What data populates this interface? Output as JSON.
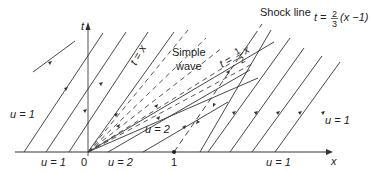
{
  "figure": {
    "type": "characteristics-diagram",
    "colors": {
      "line": "#333333",
      "background": "#ffffff"
    },
    "axes": {
      "x_label": "x",
      "t_label": "t",
      "origin_label": "0",
      "tick_one_label": "1"
    },
    "region_labels": {
      "left_upper": "u = 1",
      "left_axis": "u = 1",
      "middle_axis": "u = 2",
      "middle_region": "u = 2",
      "right_axis": "u = 1",
      "right_upper": "u = 1"
    },
    "annotations": {
      "simple_wave_line1": "Simple",
      "simple_wave_line2": "wave",
      "line_t_eq_x": "t = x",
      "line_t_half_x_prefix": "t =",
      "line_t_half_x_num": "1",
      "line_t_half_x_den": "2",
      "line_t_half_x_var": "x",
      "shock_label": "Shock line",
      "shock_eq_prefix": "t =",
      "shock_eq_num": "2",
      "shock_eq_den": "3",
      "shock_eq_suffix": "(x −1)"
    }
  }
}
